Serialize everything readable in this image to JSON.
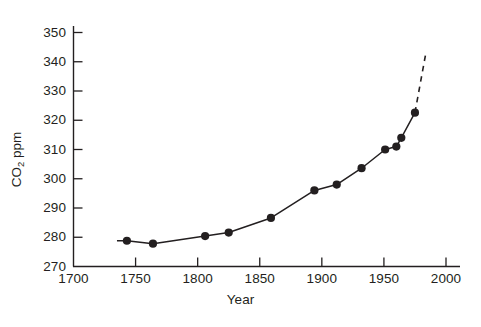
{
  "chart_data": {
    "type": "line",
    "title": "",
    "xlabel": "Year",
    "ylabel": "CO2 ppm",
    "ylabel_base": "CO",
    "ylabel_sub": "2",
    "ylabel_unit": "ppm",
    "xlim": [
      1700,
      2000
    ],
    "ylim": [
      270,
      350
    ],
    "xticks": [
      1700,
      1750,
      1800,
      1850,
      1900,
      1950,
      2000
    ],
    "yticks": [
      270,
      280,
      290,
      300,
      310,
      320,
      330,
      340,
      350
    ],
    "grid": false,
    "legend": false,
    "tick_direction": "in",
    "series": [
      {
        "name": "CO2 concentration (ice core / measured)",
        "style": "solid-with-markers",
        "marker": "filled-circle",
        "color": "#231f20",
        "x": [
          1735,
          1743,
          1764,
          1806,
          1825,
          1859,
          1894,
          1912,
          1932,
          1951,
          1960,
          1964,
          1975
        ],
        "y": [
          278.8,
          278.8,
          277.8,
          280.4,
          281.6,
          286.6,
          296.0,
          298.0,
          303.6,
          310.0,
          311.0,
          314.0,
          322.6
        ],
        "markers_shown": [
          false,
          true,
          true,
          true,
          true,
          true,
          true,
          true,
          true,
          true,
          true,
          true,
          true
        ]
      },
      {
        "name": "Projection",
        "style": "dashed",
        "color": "#231f20",
        "x": [
          1975,
          1984
        ],
        "y": [
          322.6,
          343.5
        ]
      }
    ],
    "annotations": []
  },
  "axes": {
    "y_tick_labels": [
      "350",
      "340",
      "330",
      "320",
      "310",
      "300",
      "290",
      "280",
      "270"
    ],
    "x_tick_labels": [
      "1700",
      "1750",
      "1800",
      "1850",
      "1900",
      "1950",
      "2000"
    ],
    "x_title": "Year",
    "y_title_main": "CO",
    "y_title_sub": "2",
    "y_title_unit": " ppm"
  },
  "style": {
    "axis_color": "#231f20",
    "line_color": "#231f20",
    "marker_color": "#231f20",
    "background": "#ffffff"
  }
}
